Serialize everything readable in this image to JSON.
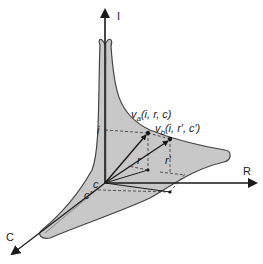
{
  "diagram": {
    "axes": {
      "i_axis_label": "I",
      "r_axis_label": "R",
      "c_axis_label": "C"
    },
    "vectors": {
      "va": {
        "name": "v",
        "sub": "a",
        "args": "(i, r, c)"
      },
      "vb": {
        "name": "v",
        "sub": "b",
        "args": "(i, r′, c′)"
      }
    },
    "projection_labels": {
      "i": "i",
      "r": "r",
      "r_prime": "r′",
      "c": "c",
      "c_prime": "c′"
    },
    "colors": {
      "surface_fill": "#c8c8c8",
      "surface_stroke": "#444444",
      "axis": "#1a1a1a"
    }
  }
}
